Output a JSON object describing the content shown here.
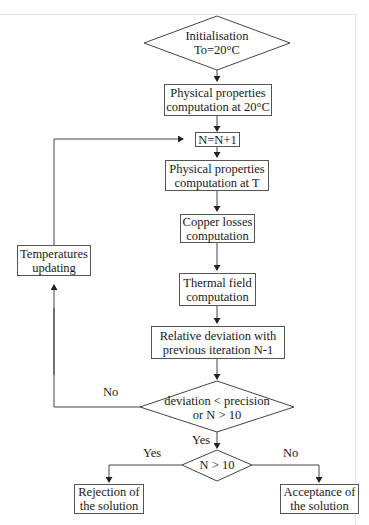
{
  "diagram": {
    "nodes": {
      "init": {
        "type": "decision",
        "line1": "Initialisation",
        "line2": "To=20°C"
      },
      "props20": {
        "type": "process",
        "line1": "Physical properties",
        "line2": "computation at 20°C"
      },
      "increment": {
        "type": "process",
        "line1": "N=N+1"
      },
      "propsT": {
        "type": "process",
        "line1": "Physical properties",
        "line2": "computation at T"
      },
      "copper": {
        "type": "process",
        "line1": "Copper losses",
        "line2": "computation"
      },
      "thermal": {
        "type": "process",
        "line1": "Thermal field",
        "line2": "computation"
      },
      "deviation": {
        "type": "process",
        "line1": "Relative deviation with",
        "line2": "previous iteration N-1"
      },
      "convergence": {
        "type": "decision",
        "line1": "deviation < precision",
        "line2": "or N > 10"
      },
      "maxiter": {
        "type": "decision",
        "line1": "N > 10"
      },
      "update": {
        "type": "process",
        "line1": "Temperatures",
        "line2": "updating"
      },
      "reject": {
        "type": "terminal",
        "line1": "Rejection of",
        "line2": "the solution"
      },
      "accept": {
        "type": "terminal",
        "line1": "Acceptance of",
        "line2": "the solution"
      }
    },
    "edge_labels": {
      "convergence_no": "No",
      "convergence_yes": "Yes",
      "maxiter_yes": "Yes",
      "maxiter_no": "No"
    },
    "colors": {
      "stroke": "#555555",
      "text": "#1a1a1a",
      "background": "#ffffff"
    }
  }
}
